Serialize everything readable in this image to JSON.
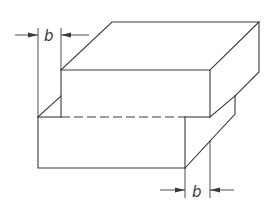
{
  "diagram": {
    "type": "isometric technical drawing",
    "line_color": "#3a3a3a",
    "background": "#ffffff",
    "dimensions": [
      {
        "id": "offset-top-left",
        "label": "b"
      },
      {
        "id": "offset-bottom-right",
        "label": "b"
      }
    ],
    "parts": [
      {
        "id": "upper-block",
        "label": ""
      },
      {
        "id": "lower-block",
        "label": ""
      }
    ]
  }
}
